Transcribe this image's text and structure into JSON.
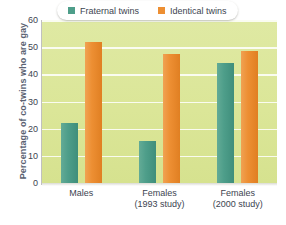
{
  "chart_data": {
    "type": "bar",
    "title": "",
    "xlabel": "",
    "ylabel": "Percentage of co-twins who are gay",
    "ylim": [
      0,
      60
    ],
    "ytick_step": 10,
    "yticks": [
      0,
      10,
      20,
      30,
      40,
      50,
      60
    ],
    "ytick_labels": [
      "0",
      "10",
      "20",
      "30",
      "40",
      "50",
      "60"
    ],
    "grid": true,
    "legend_position": "top-center",
    "categories": [
      "Males",
      "Females (1993 study)",
      "Females (2000 study)"
    ],
    "category_lines": [
      {
        "main": "Males",
        "sub": ""
      },
      {
        "main": "Females",
        "sub": "(1993 study)"
      },
      {
        "main": "Females",
        "sub": "(2000 study)"
      }
    ],
    "series": [
      {
        "name": "Fraternal twins",
        "color": "#4e9e8a",
        "values": [
          22,
          15.5,
          44
        ]
      },
      {
        "name": "Identical twins",
        "color": "#ed8f33",
        "values": [
          52,
          47.5,
          48.5
        ]
      }
    ],
    "plot_background": "#dbe698",
    "gridline_color": "#ffffff",
    "axis_label_color": "#5a6272"
  },
  "legend": {
    "items": [
      {
        "label": "Fraternal twins",
        "swatch": "fraternal"
      },
      {
        "label": "Identical twins",
        "swatch": "identical"
      }
    ]
  }
}
